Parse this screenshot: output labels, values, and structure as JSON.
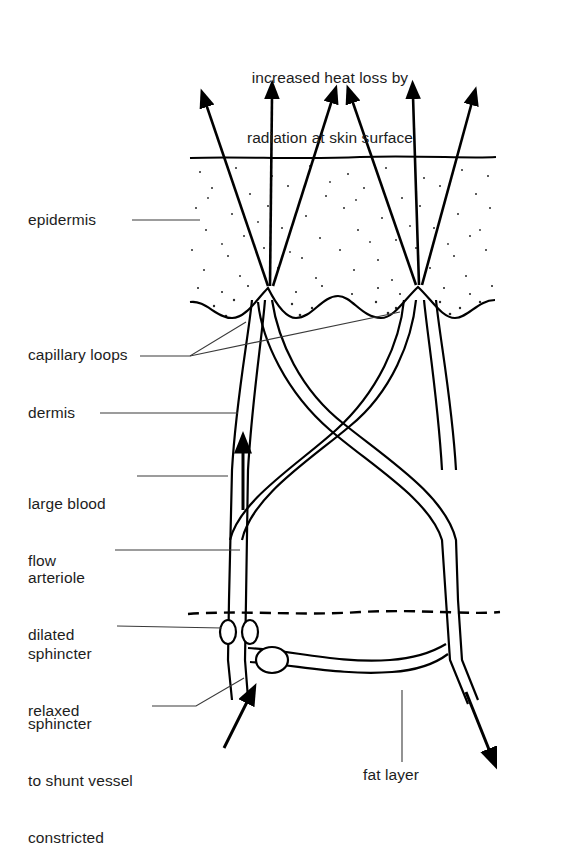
{
  "figure": {
    "kind": "skin-thermoregulation-vasodilation-diagram",
    "background_color": "#ffffff",
    "ink_color": "#000000",
    "title_lines": [
      "increased heat loss by",
      "radiation at skin surface"
    ]
  },
  "labels": {
    "epidermis": "epidermis",
    "capillary_loops": "capillary loops",
    "dermis": "dermis",
    "large_blood_flow_line1": "large blood",
    "large_blood_flow_line2": "flow",
    "arteriole_line1": "arteriole",
    "arteriole_line2": "dilated",
    "sphincter_relaxed_line1": "sphincter",
    "sphincter_relaxed_line2": "relaxed",
    "sphincter_shunt_line1": "sphincter",
    "sphincter_shunt_line2": "to shunt vessel",
    "sphincter_shunt_line3": "constricted",
    "fat_layer": "fat layer"
  },
  "icons": {
    "radiation_arrow": "arrow-up-icon",
    "blood_flow_arrow": "arrow-up-icon",
    "inflow_arrow": "arrow-up-right-icon",
    "outflow_arrow": "arrow-down-right-icon"
  },
  "structures": {
    "skin_surface_line_y": 158,
    "dermis_fat_boundary_y": 612,
    "epidermis_stipple": true,
    "capillary_loop_apex_x": [
      268,
      418
    ],
    "radiation_arrow_count": 6,
    "sphincter_count": 3
  }
}
